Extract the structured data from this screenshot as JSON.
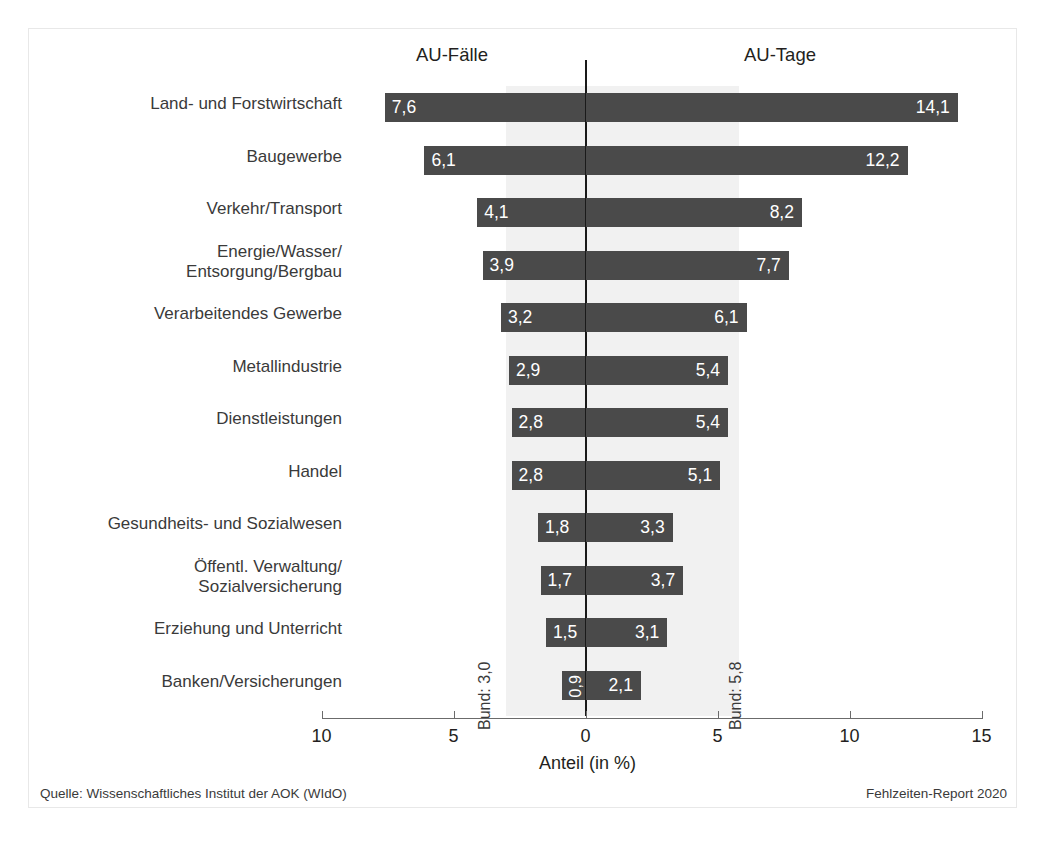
{
  "headings": {
    "left": "AU-Fälle",
    "right": "AU-Tage"
  },
  "axis": {
    "title": "Anteil (in %)",
    "tick_labels": [
      "10",
      "5",
      "0",
      "5",
      "10",
      "15"
    ]
  },
  "annotations": {
    "bund_faelle": "Bund: 3,0",
    "bund_tage": "Bund: 5,8"
  },
  "footer": {
    "source": "Quelle: Wissenschaftliches Institut der AOK (WIdO)",
    "report": "Fehlzeiten-Report 2020"
  },
  "colors": {
    "bar": "#4a4a4a",
    "band": "#f1f1f1",
    "zero_line": "#1a1a1a",
    "axis": "#6b6b6b",
    "text": "#231f20",
    "value_label": "#ffffff"
  },
  "chart_data": {
    "type": "bar",
    "title": "",
    "subtitle": "",
    "orientation": "horizontal-diverging",
    "xlabel": "Anteil (in %)",
    "ylabel": "",
    "xlim": [
      -10,
      15
    ],
    "grid": false,
    "legend_position": "top",
    "categories": [
      "Land- und Forstwirtschaft",
      "Baugewerbe",
      "Verkehr/Transport",
      "Energie/Wasser/\nEntsorgung/Bergbau",
      "Verarbeitendes Gewerbe",
      "Metallindustrie",
      "Dienstleistungen",
      "Handel",
      "Gesundheits- und Sozialwesen",
      "Öffentl. Verwaltung/\nSozialversicherung",
      "Erziehung und Unterricht",
      "Banken/Versicherungen"
    ],
    "series": [
      {
        "name": "AU-Fälle",
        "side": "left",
        "values": [
          7.6,
          6.1,
          4.1,
          3.9,
          3.2,
          2.9,
          2.8,
          2.8,
          1.8,
          1.7,
          1.5,
          0.9
        ],
        "labels": [
          "7,6",
          "6,1",
          "4,1",
          "3,9",
          "3,2",
          "2,9",
          "2,8",
          "2,8",
          "1,8",
          "1,7",
          "1,5",
          "0,9"
        ],
        "reference": 3.0,
        "reference_label": "Bund: 3,0"
      },
      {
        "name": "AU-Tage",
        "side": "right",
        "values": [
          14.1,
          12.2,
          8.2,
          7.7,
          6.1,
          5.4,
          5.4,
          5.1,
          3.3,
          3.7,
          3.1,
          2.1
        ],
        "labels": [
          "14,1",
          "12,2",
          "8,2",
          "7,7",
          "6,1",
          "5,4",
          "5,4",
          "5,1",
          "3,3",
          "3,7",
          "3,1",
          "2,1"
        ],
        "reference": 5.8,
        "reference_label": "Bund: 5,8"
      }
    ],
    "tick_values": [
      -10,
      -5,
      0,
      5,
      10,
      15
    ],
    "tick_labels": [
      "10",
      "5",
      "0",
      "5",
      "10",
      "15"
    ]
  }
}
